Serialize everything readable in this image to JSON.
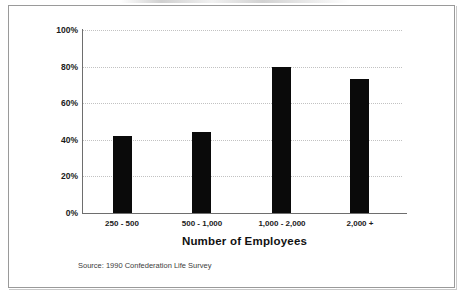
{
  "chart_data": {
    "type": "bar",
    "title": "",
    "xlabel": "Number of Employees",
    "ylabel": "",
    "categories": [
      "250 - 500",
      "500 - 1,000",
      "1,000 - 2,000",
      "2,000 +"
    ],
    "values": [
      42,
      44,
      80,
      73
    ],
    "value_suffix": "%",
    "ylim": [
      0,
      100
    ],
    "yticks": [
      0,
      20,
      40,
      60,
      80,
      100
    ],
    "ytick_labels": [
      "0%",
      "20%",
      "40%",
      "60%",
      "80%",
      "100%"
    ],
    "grid": true,
    "grid_axis": "y",
    "legend": false,
    "bar_color": "#0a0a0a",
    "grid_color": "#c2c2c2",
    "axis_color": "#6e6e6e",
    "series": [
      {
        "name": "Percent",
        "values": [
          42,
          44,
          80,
          73
        ]
      }
    ],
    "annotations": [
      "Source: 1990 Confederation Life Survey"
    ]
  },
  "figure": {
    "source_note": "Source: 1990 Confederation Life Survey",
    "border_color": "#9a9a9a",
    "background": "#ffffff"
  }
}
